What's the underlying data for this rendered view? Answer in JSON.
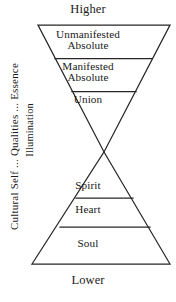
{
  "diagram": {
    "poles": {
      "top": "Higher",
      "bottom": "Lower"
    },
    "upper_triangle": {
      "orientation": "inverted",
      "tiers": [
        {
          "label": "Unmanifested\nAbsolute"
        },
        {
          "label": "Manifested\nAbsolute"
        },
        {
          "label": "Union"
        }
      ]
    },
    "lower_triangle": {
      "orientation": "upright",
      "tiers": [
        {
          "label": "Spirit"
        },
        {
          "label": "Heart"
        },
        {
          "label": "Soul"
        }
      ]
    },
    "side_labels": {
      "outer": "Cultural Self ... Qualities ... Essence",
      "inner": "Illumination"
    },
    "colors": {
      "stroke": "#262626",
      "text": "#1a1a1a",
      "background": "#ffffff"
    }
  }
}
